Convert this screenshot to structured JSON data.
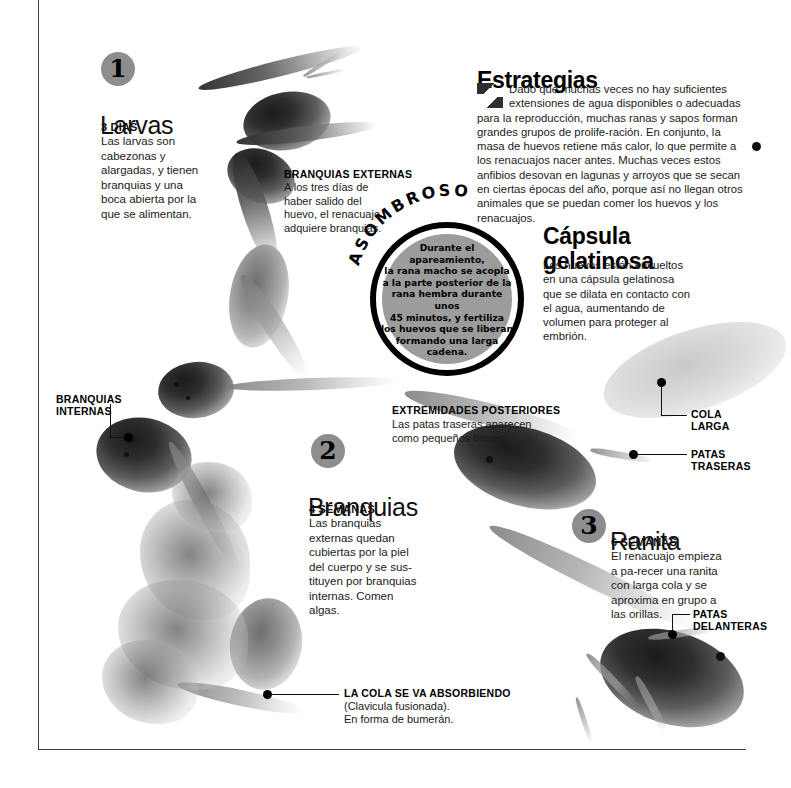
{
  "meta": {
    "headline_left": "Larvas",
    "language": "es"
  },
  "colors": {
    "badge_gray": "#8d8d8d",
    "medallion_gray": "#9c9c9c",
    "ink": "#111111",
    "frame": "#3a3a3a"
  },
  "stages": [
    {
      "number": "1",
      "title": "Larvas",
      "subtitle": "3 DÍAS",
      "body": "Las larvas son cabezonas y alargadas, y tienen branquias y una boca abierta por la que se alimentan."
    },
    {
      "number": "2",
      "title": "Branquias",
      "subtitle": "4 SEMANAS",
      "body": "Las branquias externas quedan cubiertas por la piel del cuerpo y se sus-tituyen por branquias internas. Comen algas."
    },
    {
      "number": "3",
      "title": "Ranita",
      "subtitle": "6 SEMANAS",
      "body": "El renacuajo empieza a pa-recer una ranita con larga cola y se aproxima en grupo a las orillas."
    }
  ],
  "sections": [
    {
      "title": "Estrategias",
      "body": "Dado que muchas veces no hay suficientes extensiones de agua disponibles o adecuadas para la reproducción, muchas ranas y sapos forman grandes grupos de prolife-ración. En conjunto, la masa de huevos retiene más calor, lo que permite a los renacuajos nacer antes. Muchas veces estos anfibios desovan en lagunas y arroyos que se secan en ciertas épocas del año, porque así no llegan otros animales que se puedan comer los huevos y los renacuajos."
    },
    {
      "title": "Cápsula gelatinosa",
      "body": "Los huevos están envueltos en una cápsula gelatinosa que se dilata en contacto con el agua, aumentando de volumen para proteger al embrión."
    }
  ],
  "medallion": {
    "arc_label": "ASOMBROSO",
    "lines": [
      "Durante el",
      "apareamiento,",
      "la rana macho se acopla",
      "a la parte posterior de la",
      "rana hembra durante unos",
      "45 minutos, y fertiliza",
      "los huevos que se liberan",
      "formando una larga",
      "cadena."
    ]
  },
  "callouts": [
    {
      "id": "branquias-externas",
      "title": "BRANQUIAS EXTERNAS",
      "body": "A los tres días de haber salido del huevo, el renacuajo adquiere branquias."
    },
    {
      "id": "branquias-internas",
      "title_line1": "BRANQUIAS",
      "title_line2": "INTERNAS",
      "body": ""
    },
    {
      "id": "extremidades-posteriores",
      "title": "EXTREMIDADES POSTERIORES",
      "body": "Las patas traseras aparecen como pequeños brotes."
    },
    {
      "id": "cola-larga",
      "title_line1": "COLA",
      "title_line2": "LARGA",
      "body": ""
    },
    {
      "id": "patas-traseras",
      "title_line1": "PATAS",
      "title_line2": "TRASERAS",
      "body": ""
    },
    {
      "id": "patas-delanteras",
      "title_line1": "PATAS",
      "title_line2": "DELANTERAS",
      "body": ""
    },
    {
      "id": "cola-absorbiendo",
      "title": "LA COLA SE VA ABSORBIENDO",
      "body_line1": "(Clavicula fusionada).",
      "body_line2": "En forma de bumerán."
    }
  ]
}
